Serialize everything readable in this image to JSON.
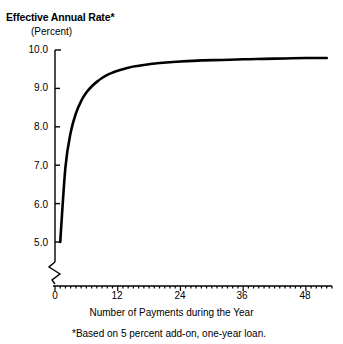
{
  "chart_data": {
    "type": "line",
    "title": "Effective Annual Rate*",
    "subtitle": "(Percent)",
    "ylabel": "(Percent)",
    "xlabel": "Number of Payments during the Year",
    "footnote": "*Based on 5 percent add-on, one-year loan.",
    "xlim": [
      0,
      53
    ],
    "ylim": [
      5.0,
      10.0
    ],
    "y_axis_break": true,
    "grid": false,
    "legend": null,
    "y_ticks": [
      "10.0",
      "9.0",
      "8.0",
      "7.0",
      "6.0",
      "5.0"
    ],
    "y_tick_values": [
      10.0,
      9.0,
      8.0,
      7.0,
      6.0,
      5.0
    ],
    "x_ticks": [
      "0",
      "12",
      "24",
      "36",
      "48"
    ],
    "x_tick_values": [
      0,
      12,
      24,
      36,
      48
    ],
    "x_minor_tick_step": 1,
    "series": [
      {
        "name": "Effective annual rate",
        "x": [
          1,
          2,
          3,
          4,
          5,
          6,
          7,
          8,
          9,
          10,
          11,
          12,
          14,
          16,
          18,
          20,
          24,
          28,
          32,
          36,
          40,
          44,
          48,
          52
        ],
        "values": [
          5.0,
          6.95,
          7.85,
          8.35,
          8.67,
          8.89,
          9.05,
          9.17,
          9.27,
          9.35,
          9.41,
          9.46,
          9.54,
          9.59,
          9.63,
          9.66,
          9.7,
          9.73,
          9.74,
          9.76,
          9.77,
          9.78,
          9.79,
          9.79
        ]
      }
    ],
    "annotations": []
  },
  "colors": {
    "line": "#000000",
    "axis": "#000000",
    "background": "#ffffff"
  }
}
